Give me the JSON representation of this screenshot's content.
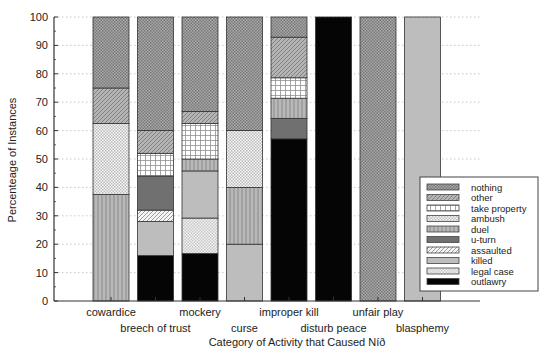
{
  "chart_data": {
    "type": "bar",
    "stacked": true,
    "title": "",
    "xlabel": "Category of Activity that Caused Níð",
    "ylabel": "Percenteage of Instances",
    "ylim": [
      0,
      100
    ],
    "yticks": [
      0,
      10,
      20,
      30,
      40,
      50,
      60,
      70,
      80,
      90,
      100
    ],
    "grid": "horizontal dotted",
    "legend_position": "lower right, inside plot",
    "categories": [
      "cowardice",
      "breech of trust",
      "mockery",
      "curse",
      "improper kill",
      "disturb peace",
      "unfair play",
      "blasphemy"
    ],
    "series": [
      {
        "name": "outlawry",
        "values": [
          0,
          16,
          16.7,
          0,
          57.1,
          100,
          0,
          0
        ]
      },
      {
        "name": "legal case",
        "values": [
          0,
          0,
          12.5,
          0,
          0,
          0,
          0,
          0
        ]
      },
      {
        "name": "killed",
        "values": [
          0,
          12,
          16.6,
          20,
          0,
          0,
          0,
          100
        ]
      },
      {
        "name": "assaulted",
        "values": [
          0,
          4,
          0,
          0,
          0,
          0,
          0,
          0
        ]
      },
      {
        "name": "u-turn",
        "values": [
          0,
          12,
          0,
          0,
          7.2,
          0,
          0,
          0
        ]
      },
      {
        "name": "duel",
        "values": [
          37.5,
          0,
          4.2,
          20,
          7.1,
          0,
          0,
          0
        ]
      },
      {
        "name": "ambush",
        "values": [
          25,
          0,
          0,
          20,
          0,
          0,
          0,
          0
        ]
      },
      {
        "name": "take property",
        "values": [
          0,
          8,
          12.5,
          0,
          7.2,
          0,
          0,
          0
        ]
      },
      {
        "name": "other",
        "values": [
          12.5,
          8,
          4.2,
          0,
          14.3,
          0,
          0,
          0
        ]
      },
      {
        "name": "nothing",
        "values": [
          25,
          40,
          33.3,
          40,
          7.1,
          0,
          100,
          0
        ]
      }
    ],
    "legend_order": [
      "nothing",
      "other",
      "take property",
      "ambush",
      "duel",
      "u-turn",
      "assaulted",
      "killed",
      "legal case",
      "outlawry"
    ]
  },
  "styles": {
    "outlawry": {
      "pattern": "solid",
      "color": "#050505"
    },
    "legal case": {
      "pattern": "checker",
      "color": "#c8c8c8",
      "bg": "#f2f2f2"
    },
    "killed": {
      "pattern": "solid",
      "color": "#bdbdbd"
    },
    "assaulted": {
      "pattern": "diag",
      "color": "#9a9a9a",
      "bg": "#f4f4f4"
    },
    "u-turn": {
      "pattern": "solid",
      "color": "#707070"
    },
    "duel": {
      "pattern": "vlines",
      "color": "#8a8a8a",
      "bg": "#b8b8b8"
    },
    "ambush": {
      "pattern": "checker",
      "color": "#bcbcbc",
      "bg": "#f6f6f6"
    },
    "take property": {
      "pattern": "grid",
      "color": "#8f8f8f",
      "bg": "#ffffff"
    },
    "other": {
      "pattern": "diag",
      "color": "#808080",
      "bg": "#b5b5b5"
    },
    "nothing": {
      "pattern": "checker",
      "color": "#7a7a7a",
      "bg": "#a8a8a8"
    }
  }
}
